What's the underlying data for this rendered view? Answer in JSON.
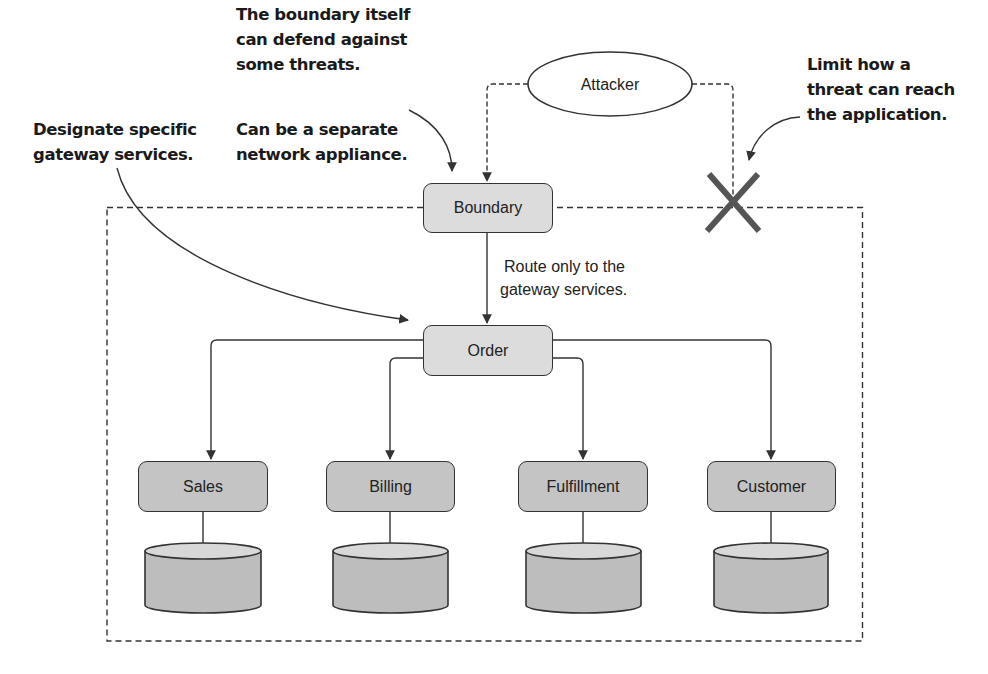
{
  "annotations": {
    "gateway": [
      "Designate specific",
      "gateway services."
    ],
    "boundary_defend": [
      "The boundary itself",
      "can defend against",
      "some threats."
    ],
    "boundary_appliance": [
      "Can be a separate",
      "network appliance."
    ],
    "limit_threat": [
      "Limit how a",
      "threat can reach",
      "the application."
    ]
  },
  "attacker": {
    "label": "Attacker"
  },
  "boundary": {
    "label": "Boundary"
  },
  "order": {
    "label": "Order"
  },
  "route_note": [
    "Route only to the",
    "gateway services."
  ],
  "services": [
    {
      "label": "Sales"
    },
    {
      "label": "Billing"
    },
    {
      "label": "Fulfillment"
    },
    {
      "label": "Customer"
    }
  ],
  "colors": {
    "line": "#333333",
    "box_light": "#dcdcdc",
    "box_dark": "#c4c4c4",
    "db_body": "#bdbdbd",
    "db_top": "#d8d8d8",
    "blocked_x": "#555555"
  }
}
